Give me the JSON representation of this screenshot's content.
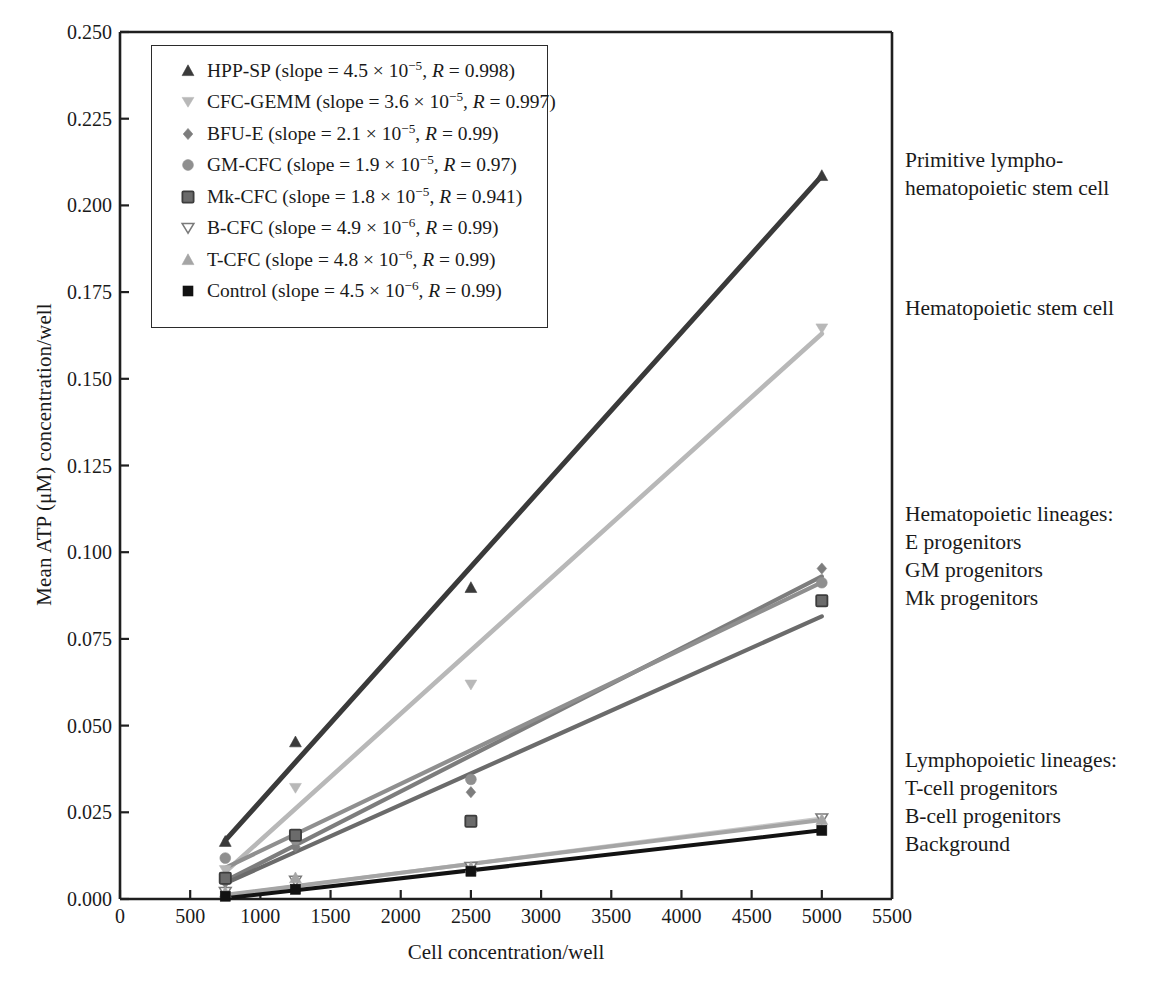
{
  "chart_data": {
    "type": "scatter",
    "title": "",
    "xlabel": "Cell concentration/well",
    "ylabel": "Mean ATP (μM) concentration/well",
    "xlim": [
      0,
      5500
    ],
    "ylim": [
      0,
      0.25
    ],
    "xticks": [
      0,
      500,
      1000,
      1500,
      2000,
      2500,
      3000,
      3500,
      4000,
      4500,
      5000,
      5500
    ],
    "xtick_labels": [
      "0",
      "500",
      "1000",
      "1500",
      "2000",
      "2500",
      "3000",
      "3500",
      "4000",
      "4500",
      "5000",
      "5500"
    ],
    "yticks": [
      0.0,
      0.025,
      0.05,
      0.075,
      0.1,
      0.125,
      0.15,
      0.175,
      0.2,
      0.225,
      0.25
    ],
    "ytick_labels": [
      "0.000",
      "0.025",
      "0.050",
      "0.075",
      "0.100",
      "0.125",
      "0.150",
      "0.175",
      "0.200",
      "0.225",
      "0.250"
    ],
    "grid": false,
    "legend_position": "upper-left",
    "x": [
      750,
      1250,
      2500,
      5000
    ],
    "series": [
      {
        "name": "HPP-SP",
        "slope": 4.5e-05,
        "slope_text": "4.5 × 10⁻⁵",
        "R": 0.998,
        "marker": "triangle-up",
        "color": "#3a3a3a",
        "values": [
          0.0165,
          0.0452,
          0.0897,
          0.2085
        ],
        "fit": [
          [
            750,
            0.0169
          ],
          [
            5000,
            0.2085
          ]
        ]
      },
      {
        "name": "CFC-GEMM",
        "slope": 3.6e-05,
        "slope_text": "3.6 × 10⁻⁵",
        "R": 0.997,
        "marker": "triangle-down",
        "color": "#b8b8b8",
        "values": [
          0.0083,
          0.032,
          0.0618,
          0.1645
        ],
        "fit": [
          [
            750,
            0.0078
          ],
          [
            5000,
            0.163
          ]
        ]
      },
      {
        "name": "BFU-E",
        "slope": 2.1e-05,
        "slope_text": "2.1 × 10⁻⁵",
        "R": 0.99,
        "marker": "diamond",
        "color": "#7d7d7d",
        "values": [
          0.0048,
          0.015,
          0.0308,
          0.0953
        ],
        "fit": [
          [
            750,
            0.0052
          ],
          [
            5000,
            0.093
          ]
        ]
      },
      {
        "name": "GM-CFC",
        "slope": 1.9e-05,
        "slope_text": "1.9 × 10⁻⁵",
        "R": 0.97,
        "marker": "circle",
        "color": "#8f8f8f",
        "values": [
          0.0118,
          0.0172,
          0.0345,
          0.0912
        ],
        "fit": [
          [
            750,
            0.009
          ],
          [
            5000,
            0.0913
          ]
        ]
      },
      {
        "name": "Mk-CFC",
        "slope": 1.8e-05,
        "slope_text": "1.8 × 10⁻⁵",
        "R": 0.941,
        "marker": "square-grey",
        "color": "#6b6b6b",
        "values": [
          0.006,
          0.0184,
          0.0224,
          0.086
        ],
        "fit": [
          [
            750,
            0.0045
          ],
          [
            5000,
            0.0815
          ]
        ]
      },
      {
        "name": "B-CFC",
        "slope": 4.9e-06,
        "slope_text": "4.9 × 10⁻⁶",
        "R": 0.99,
        "marker": "triangle-down-open",
        "color": "#c9c9c9",
        "values": [
          0.002,
          0.0052,
          0.0092,
          0.0232
        ],
        "fit": [
          [
            750,
            0.001
          ],
          [
            5000,
            0.0232
          ]
        ]
      },
      {
        "name": "T-CFC",
        "slope": 4.8e-06,
        "slope_text": "4.8 × 10⁻⁶",
        "R": 0.99,
        "marker": "triangle-up-grey",
        "color": "#a5a5a5",
        "values": [
          0.0018,
          0.006,
          0.009,
          0.0228
        ],
        "fit": [
          [
            750,
            0.0012
          ],
          [
            5000,
            0.0228
          ]
        ]
      },
      {
        "name": "Control",
        "slope": 4.5e-06,
        "slope_text": "4.5 × 10⁻⁶",
        "R": 0.99,
        "marker": "square-black",
        "color": "#121212",
        "values": [
          0.0008,
          0.0028,
          0.008,
          0.0198
        ],
        "fit": [
          [
            750,
            0.0002
          ],
          [
            5000,
            0.0198
          ]
        ]
      }
    ],
    "legend_entries": [
      {
        "label": "HPP-SP",
        "prefix": "HPP-SP (slope = ",
        "mantissa": "4.5 × 10",
        "exp": "−5",
        "rsep": ", ",
        "ritalic": "R",
        "rval": " = 0.998)"
      },
      {
        "label": "CFC-GEMM",
        "prefix": "CFC-GEMM (slope = ",
        "mantissa": "3.6 × 10",
        "exp": "−5",
        "rsep": ", ",
        "ritalic": "R",
        "rval": " = 0.997)"
      },
      {
        "label": "BFU-E",
        "prefix": "BFU-E (slope = ",
        "mantissa": "2.1 × 10",
        "exp": "−5",
        "rsep": ", ",
        "ritalic": "R",
        "rval": " = 0.99)"
      },
      {
        "label": "GM-CFC",
        "prefix": "GM-CFC (slope = ",
        "mantissa": "1.9 × 10",
        "exp": "−5",
        "rsep": ", ",
        "ritalic": "R",
        "rval": " = 0.97)"
      },
      {
        "label": "Mk-CFC",
        "prefix": "Mk-CFC (slope = ",
        "mantissa": "1.8 × 10",
        "exp": "−5",
        "rsep": ", ",
        "ritalic": "R",
        "rval": " = 0.941)"
      },
      {
        "label": "B-CFC",
        "prefix": "B-CFC (slope = ",
        "mantissa": "4.9 × 10",
        "exp": "−6",
        "rsep": ", ",
        "ritalic": "R",
        "rval": " = 0.99)"
      },
      {
        "label": "T-CFC",
        "prefix": "T-CFC (slope = ",
        "mantissa": "4.8 × 10",
        "exp": "−6",
        "rsep": ", ",
        "ritalic": "R",
        "rval": " = 0.99)"
      },
      {
        "label": "Control",
        "prefix": "Control (slope = ",
        "mantissa": "4.5 × 10",
        "exp": "−6",
        "rsep": ", ",
        "ritalic": "R",
        "rval": " = 0.99)"
      }
    ],
    "annotations": [
      {
        "text": "Primitive lympho-\nhematopoietic stem cell",
        "y_value": 0.213
      },
      {
        "text": "Hematopoietic stem cell",
        "y_value": 0.1705
      },
      {
        "text": "Hematopoietic lineages:\nE progenitors\nGM progenitors\nMk progenitors",
        "y_value": 0.111
      },
      {
        "text": "Lymphopoietic lineages:\nT-cell progenitors\nB-cell progenitors\nBackground",
        "y_value": 0.04
      }
    ]
  },
  "colors": {
    "axis": "#1f1f1f",
    "legend_border": "#2b2b2b",
    "background": "#ffffff"
  }
}
